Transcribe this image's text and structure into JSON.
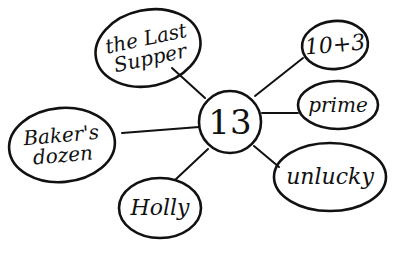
{
  "diagram": {
    "type": "mind-map",
    "style": "hand-drawn",
    "ink_color": "#111111",
    "background": "#ffffff",
    "center": {
      "label": "13",
      "cx": 230,
      "cy": 122,
      "r": 31,
      "font_size": 34
    },
    "nodes": [
      {
        "id": "last-supper",
        "label": "the Last\nSupper",
        "cx": 148,
        "cy": 48,
        "rx": 53,
        "ry": 38,
        "font_size": 20,
        "rot": -12,
        "edge": {
          "x1": 172,
          "y1": 68,
          "x2": 205,
          "y2": 98
        }
      },
      {
        "id": "ten-plus-three",
        "label": "10+3",
        "cx": 335,
        "cy": 45,
        "rx": 33,
        "ry": 24,
        "font_size": 22,
        "rot": -5,
        "edge": {
          "x1": 303,
          "y1": 58,
          "x2": 255,
          "y2": 96
        }
      },
      {
        "id": "prime",
        "label": "prime",
        "cx": 338,
        "cy": 105,
        "rx": 40,
        "ry": 24,
        "font_size": 20,
        "rot": 0,
        "edge": {
          "x1": 298,
          "y1": 113,
          "x2": 262,
          "y2": 113
        }
      },
      {
        "id": "unlucky",
        "label": "unlucky",
        "cx": 330,
        "cy": 177,
        "rx": 56,
        "ry": 34,
        "font_size": 22,
        "rot": 0,
        "edge": {
          "x1": 279,
          "y1": 167,
          "x2": 254,
          "y2": 146
        }
      },
      {
        "id": "bakers-dozen",
        "label": "Baker's\ndozen",
        "cx": 62,
        "cy": 145,
        "rx": 53,
        "ry": 37,
        "font_size": 20,
        "rot": -5,
        "edge": {
          "x1": 122,
          "y1": 133,
          "x2": 199,
          "y2": 127
        }
      },
      {
        "id": "holly",
        "label": "Holly",
        "cx": 160,
        "cy": 208,
        "rx": 41,
        "ry": 30,
        "font_size": 22,
        "rot": 0,
        "edge": {
          "x1": 175,
          "y1": 180,
          "x2": 208,
          "y2": 149
        }
      }
    ]
  }
}
